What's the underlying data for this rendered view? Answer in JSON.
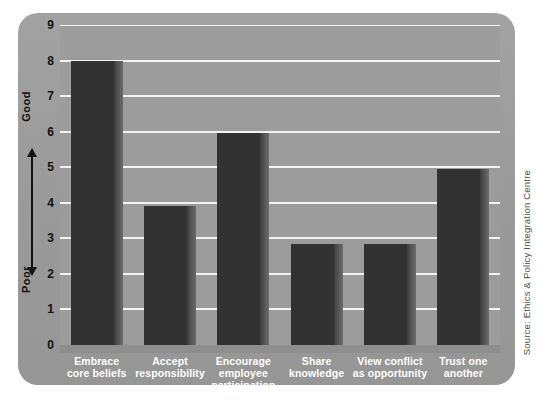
{
  "chart_data": {
    "type": "bar",
    "title": "",
    "xlabel": "",
    "ylabel": "",
    "ylim": [
      0,
      9
    ],
    "grid": true,
    "legend": false,
    "axis_direction_labels": {
      "top": "Good",
      "bottom": "Poor"
    },
    "yticks": [
      "9",
      "8",
      "7",
      "6",
      "5",
      "4",
      "3",
      "2",
      "1",
      "0"
    ],
    "categories": [
      "Embrace\ncore beliefs",
      "Accept\nresponsibility",
      "Encourage\nemployee\nparticipation",
      "Share\nknowledge",
      "View conflict\nas opportunity",
      "Trust one\nanother"
    ],
    "values": [
      8.0,
      3.9,
      5.95,
      2.85,
      2.85,
      4.95
    ],
    "source_note": "Source: Ethics & Policy Integration Centre"
  },
  "axis": {
    "ticks": [
      {
        "label": "9",
        "value": 9
      },
      {
        "label": "8",
        "value": 8
      },
      {
        "label": "7",
        "value": 7
      },
      {
        "label": "6",
        "value": 6
      },
      {
        "label": "5",
        "value": 5
      },
      {
        "label": "4",
        "value": 4
      },
      {
        "label": "3",
        "value": 3
      },
      {
        "label": "2",
        "value": 2
      },
      {
        "label": "1",
        "value": 1
      },
      {
        "label": "0",
        "value": 0
      }
    ],
    "good_label": "Good",
    "poor_label": "Poor"
  },
  "bars": [
    {
      "label_line1": "Embrace",
      "label_line2": "core beliefs",
      "label_line3": "",
      "value": 8.0
    },
    {
      "label_line1": "Accept",
      "label_line2": "responsibility",
      "label_line3": "",
      "value": 3.9
    },
    {
      "label_line1": "Encourage",
      "label_line2": "employee",
      "label_line3": "participation",
      "value": 5.95
    },
    {
      "label_line1": "Share",
      "label_line2": "knowledge",
      "label_line3": "",
      "value": 2.85
    },
    {
      "label_line1": "View conflict",
      "label_line2": "as opportunity",
      "label_line3": "",
      "value": 2.85
    },
    {
      "label_line1": "Trust one",
      "label_line2": "another",
      "label_line3": "",
      "value": 4.95
    }
  ],
  "footer": {
    "source": "Source: Ethics & Policy Integration Centre"
  },
  "colors": {
    "bar": "#333232",
    "bar_edge": "#6d6b6b",
    "plot_background": "#9c9c9c",
    "card_background": "#9a9a9a",
    "gridline": "#f2f2f2",
    "label_text": "#ffffff",
    "tick_text": "#111111"
  }
}
